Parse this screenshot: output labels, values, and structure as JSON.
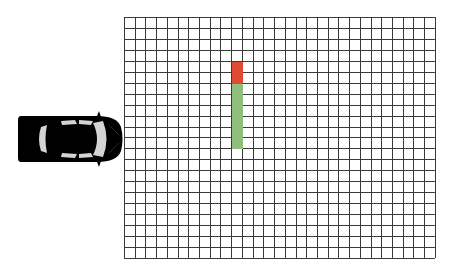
{
  "scene": {
    "width": 451,
    "height": 277,
    "background": "#ffffff"
  },
  "grid": {
    "left": 124,
    "top": 17,
    "cols": 29,
    "rows": 22,
    "cell_w": 10.72,
    "cell_h": 10.95,
    "line_color": "#3a3a3a",
    "line_width": 1
  },
  "cells": [
    {
      "col": 10,
      "row": 4,
      "state": "blocked",
      "color": "#e04a34"
    },
    {
      "col": 10,
      "row": 5,
      "state": "blocked",
      "color": "#e04a34"
    },
    {
      "col": 10,
      "row": 6,
      "state": "free",
      "color": "#8fbf7f"
    },
    {
      "col": 10,
      "row": 7,
      "state": "free",
      "color": "#8fbf7f"
    },
    {
      "col": 10,
      "row": 8,
      "state": "free",
      "color": "#8fbf7f"
    },
    {
      "col": 10,
      "row": 9,
      "state": "free",
      "color": "#8fbf7f"
    },
    {
      "col": 10,
      "row": 10,
      "state": "free",
      "color": "#8fbf7f"
    },
    {
      "col": 10,
      "row": 11,
      "state": "free",
      "color": "#8fbf7f"
    }
  ],
  "car": {
    "icon": "car-top-view-icon",
    "left": 17,
    "top": 113,
    "width": 108,
    "height": 52,
    "heading": "right",
    "body_color": "#000000",
    "glass_color": "#d4d4d4"
  }
}
